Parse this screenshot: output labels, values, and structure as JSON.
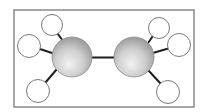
{
  "diagram": {
    "frame": {
      "x": 14,
      "y": 10,
      "width": 180,
      "height": 97,
      "stroke": "#8a8a8a"
    },
    "colors": {
      "carbon_light": "#f2f2f2",
      "carbon_mid": "#cfcfcf",
      "carbon_dark": "#9a9a9a",
      "carbon_stroke": "#8c8c8c",
      "hydrogen_fill": "#ffffff",
      "hydrogen_stroke": "#7a7a7a",
      "bond": "#1e1e1e"
    },
    "atoms": [
      {
        "id": "C1",
        "element": "carbon",
        "cx": 72,
        "cy": 57,
        "r": 20
      },
      {
        "id": "C2",
        "element": "carbon",
        "cx": 134,
        "cy": 57,
        "r": 20
      },
      {
        "id": "H1",
        "element": "hydrogen",
        "cx": 52,
        "cy": 25,
        "r": 10.5
      },
      {
        "id": "H2",
        "element": "hydrogen",
        "cx": 29,
        "cy": 46,
        "r": 11.5
      },
      {
        "id": "H3",
        "element": "hydrogen",
        "cx": 38,
        "cy": 91,
        "r": 11.5
      },
      {
        "id": "H4",
        "element": "hydrogen",
        "cx": 159,
        "cy": 28,
        "r": 10.5
      },
      {
        "id": "H5",
        "element": "hydrogen",
        "cx": 179,
        "cy": 45,
        "r": 11.5
      },
      {
        "id": "H6",
        "element": "hydrogen",
        "cx": 168,
        "cy": 92,
        "r": 11.5
      }
    ],
    "bonds": [
      {
        "from": "C1",
        "to": "C2",
        "x1": 92,
        "y1": 57.5,
        "x2": 114,
        "y2": 57.5
      },
      {
        "from": "C1",
        "to": "H1",
        "x1": 55,
        "y1": 30,
        "x2": 63,
        "y2": 41
      },
      {
        "from": "C1",
        "to": "H2",
        "x1": 40,
        "y1": 49,
        "x2": 58,
        "y2": 55
      },
      {
        "from": "C1",
        "to": "H3",
        "x1": 45,
        "y1": 83,
        "x2": 57,
        "y2": 69
      },
      {
        "from": "C2",
        "to": "H4",
        "x1": 148,
        "y1": 43,
        "x2": 155,
        "y2": 33
      },
      {
        "from": "C2",
        "to": "H5",
        "x1": 146,
        "y1": 55,
        "x2": 170,
        "y2": 48
      },
      {
        "from": "C2",
        "to": "H6",
        "x1": 148,
        "y1": 70,
        "x2": 161,
        "y2": 84
      }
    ]
  }
}
